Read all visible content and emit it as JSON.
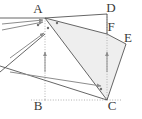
{
  "figure": {
    "type": "geometry-diagram",
    "width": 142,
    "height": 119,
    "background_color": "#ffffff",
    "stroke_color": "#555555",
    "dotted_color": "#b0b0b0",
    "arrow_color": "#8c8c8c",
    "shade_color": "#eeeeee",
    "label_color": "#3a3a3a",
    "points": {
      "A": {
        "label": "A",
        "x": 45,
        "y": 18,
        "label_x": 38,
        "label_y": 13
      },
      "B": {
        "label": "B",
        "x": 45,
        "y": 100,
        "label_x": 38,
        "label_y": 110
      },
      "C": {
        "label": "C",
        "x": 107,
        "y": 100,
        "label_x": 112,
        "label_y": 110
      },
      "D": {
        "label": "D",
        "x": 107,
        "y": 14,
        "label_x": 111,
        "label_y": 12
      },
      "F": {
        "label": "F",
        "x": 107,
        "y": 34,
        "label_x": 111,
        "label_y": 31
      },
      "E": {
        "label": "E",
        "x": 126,
        "y": 44,
        "label_x": 128,
        "label_y": 42
      }
    },
    "solid_segments": [
      {
        "name": "segment-A-D",
        "x1": 45,
        "y1": 18,
        "x2": 107,
        "y2": 14
      },
      {
        "name": "segment-D-F",
        "x1": 107,
        "y1": 14,
        "x2": 107,
        "y2": 34
      },
      {
        "name": "segment-A-F",
        "x1": 45,
        "y1": 18,
        "x2": 107,
        "y2": 34
      },
      {
        "name": "segment-F-E",
        "x1": 107,
        "y1": 34,
        "x2": 126,
        "y2": 44
      },
      {
        "name": "segment-E-C",
        "x1": 126,
        "y1": 44,
        "x2": 107,
        "y2": 100
      },
      {
        "name": "segment-A-C",
        "x1": 45,
        "y1": 18,
        "x2": 107,
        "y2": 100
      },
      {
        "name": "segment-left-upper",
        "x1": 0,
        "y1": 18,
        "x2": 45,
        "y2": 18
      },
      {
        "name": "segment-left-to-mid",
        "x1": 0,
        "y1": 72,
        "x2": 45,
        "y2": 34
      },
      {
        "name": "segment-left-lower",
        "x1": 0,
        "y1": 66,
        "x2": 107,
        "y2": 100
      }
    ],
    "dotted_segments": [
      {
        "name": "dotted-A-B",
        "x1": 45,
        "y1": 18,
        "x2": 45,
        "y2": 100
      },
      {
        "name": "dotted-D-C",
        "x1": 107,
        "y1": 14,
        "x2": 107,
        "y2": 100
      },
      {
        "name": "dotted-B-C",
        "x1": 45,
        "y1": 100,
        "x2": 107,
        "y2": 100
      },
      {
        "name": "dotted-B-left",
        "x1": 45,
        "y1": 100,
        "x2": 30,
        "y2": 100
      },
      {
        "name": "dotted-C-right",
        "x1": 107,
        "y1": 100,
        "x2": 122,
        "y2": 100
      }
    ],
    "shaded_region": {
      "name": "shaded-quadrilateral-AFEC",
      "points": "45,18 107,34 126,44 107,100"
    },
    "vectors": [
      {
        "name": "vector-to-A-upper",
        "x1": 2,
        "y1": 24,
        "x2": 43,
        "y2": 20
      },
      {
        "name": "vector-to-A-mid",
        "x1": 2,
        "y1": 30,
        "x2": 43,
        "y2": 22
      },
      {
        "name": "vector-to-mid-point",
        "x1": 10,
        "y1": 58,
        "x2": 44,
        "y2": 33
      },
      {
        "name": "vector-up-left-column",
        "x1": 45,
        "y1": 72,
        "x2": 45,
        "y2": 52
      },
      {
        "name": "vector-up-right-column",
        "x1": 107,
        "y1": 72,
        "x2": 107,
        "y2": 52
      },
      {
        "name": "vector-to-C-horizontal",
        "x1": 10,
        "y1": 72,
        "x2": 101,
        "y2": 86
      }
    ],
    "marked_points": [
      {
        "name": "marker-near-A-left",
        "x": 38,
        "y": 25
      },
      {
        "name": "marker-near-A-below",
        "x": 48,
        "y": 28
      },
      {
        "name": "marker-near-A-right",
        "x": 57,
        "y": 23
      },
      {
        "name": "marker-near-C",
        "x": 101,
        "y": 89
      }
    ]
  }
}
